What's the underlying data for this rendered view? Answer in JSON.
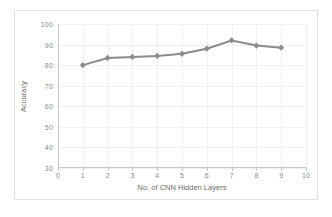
{
  "chart_data": {
    "type": "line",
    "title": "",
    "xlabel": "No. of CNN Hidden Layers",
    "ylabel": "Accuracy",
    "x": [
      1,
      2,
      3,
      4,
      5,
      6,
      7,
      8,
      9
    ],
    "values": [
      80,
      83.5,
      84,
      84.5,
      85.5,
      88,
      92,
      89.5,
      88.5
    ],
    "series": [
      {
        "name": "Accuracy",
        "values": [
          80,
          83.5,
          84,
          84.5,
          85.5,
          88,
          92,
          89.5,
          88.5
        ]
      }
    ],
    "xlim": [
      0,
      10
    ],
    "ylim": [
      30,
      100
    ],
    "xticks": [
      0,
      1,
      2,
      3,
      4,
      5,
      6,
      7,
      8,
      9,
      10
    ],
    "yticks": [
      30,
      40,
      50,
      60,
      70,
      80,
      90,
      100
    ],
    "xtick_labels": [
      "0",
      "1",
      "2",
      "3",
      "4",
      "5",
      "6",
      "7",
      "8",
      "9",
      "10"
    ],
    "ytick_labels": [
      "30",
      "40",
      "50",
      "60",
      "70",
      "80",
      "90",
      "100"
    ],
    "grid": true,
    "legend": false,
    "legend_position": "none",
    "marker": "diamond",
    "colors": {
      "series": "#8c8c8c",
      "grid": "#f0f0f0",
      "axis": "#c8c8c8",
      "tick_text": "#8a8a8a",
      "title_text": "#6e6e6e",
      "frame": "#e2e2e2",
      "background": "#ffffff"
    }
  }
}
